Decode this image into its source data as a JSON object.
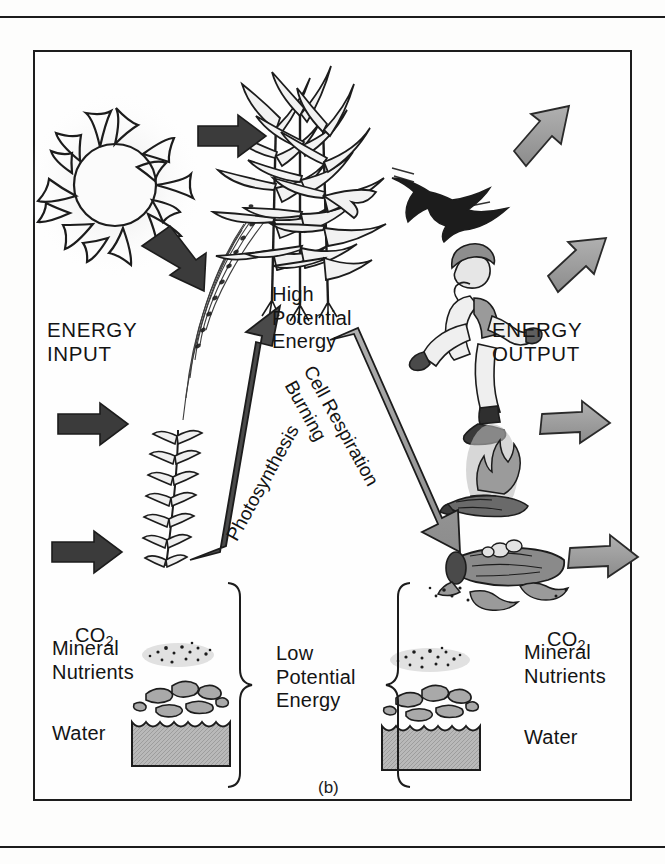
{
  "figure": {
    "caption": "(b)",
    "type": "energy-flow-diagram",
    "palette": {
      "ink": "#1c1c1c",
      "dark_arrow": "#3b3b3b",
      "gray_arrow_fill": "#9a9a9a",
      "gray_arrow_stroke": "#2a2a2a",
      "water_fill": "#b9b9b9",
      "rock_fill": "#a9a9a9",
      "page": "#fdfdfc"
    }
  },
  "labels": {
    "energy_input": "ENERGY\nINPUT",
    "energy_output": "ENERGY\nOUTPUT",
    "high_potential_energy": "High\nPotential\nEnergy",
    "low_potential_energy": "Low\nPotential\nEnergy",
    "photosynthesis": "Photosynthesis",
    "cell_respiration": "Cell Respiration",
    "burning": "Burning"
  },
  "inputs_list": {
    "co2": "CO",
    "co2_sub": "2",
    "mineral_nutrients": "Mineral\nNutrients",
    "water": "Water"
  },
  "outputs_list": {
    "co2": "CO",
    "co2_sub": "2",
    "mineral_nutrients": "Mineral\nNutrients",
    "water": "Water"
  },
  "illustrations": {
    "sun": "sun",
    "grass_sprout": "seedling",
    "corn_plants": "corn-plants",
    "bird": "flying-bird",
    "runner": "running-person",
    "campfire": "burning-log",
    "decaying_log": "decomposing-log",
    "minerals": "mineral-particles",
    "rocks": "rocks",
    "water_tank": "water-body"
  },
  "arrows": {
    "input_sun_to_plant": "black-arrow-right",
    "input_sun_down": "black-arrow-down-right",
    "input_left_upper": "black-arrow-right",
    "input_left_lower": "black-arrow-right",
    "photosynthesis_arrow": "black-arrow-up-right",
    "respiration_arrow": "gray-arrow-down-right",
    "output_top": "gray-arrow-up-right",
    "output_upper": "gray-arrow-up-right",
    "output_mid": "gray-arrow-right",
    "output_low": "gray-arrow-right"
  }
}
